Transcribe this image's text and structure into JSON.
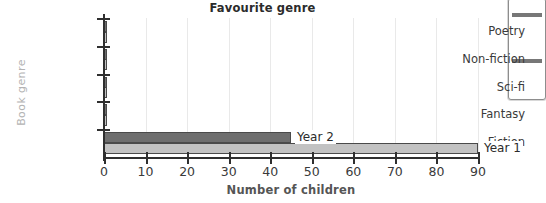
{
  "chart_data": {
    "type": "bar",
    "orientation": "horizontal",
    "title": "Favourite genre",
    "xlabel": "Number of children",
    "ylabel": "Book genre",
    "categories": [
      "Fiction",
      "Fantasy",
      "Sci-fi",
      "Non-fiction",
      "Poetry"
    ],
    "series": [
      {
        "name": "Year 2",
        "color": "#6e6e6e",
        "values": [
          45,
          0,
          0,
          0,
          0
        ]
      },
      {
        "name": "Year 1",
        "color": "#c2c2c2",
        "values": [
          90,
          0,
          0,
          0,
          0
        ]
      }
    ],
    "xlim": [
      0,
      90
    ],
    "xticks": [
      0,
      10,
      20,
      30,
      40,
      50,
      60,
      70,
      80,
      90
    ],
    "xtick_labels": [
      "0",
      "10",
      "20",
      "30",
      "40",
      "50",
      "60",
      "70",
      "80",
      "90"
    ],
    "grid": "vertical",
    "legend": "inline-bar-end-labels",
    "annotations": [
      {
        "text": "Year 2",
        "at_value": 45,
        "category": "Fiction"
      },
      {
        "text": "Year 1",
        "at_value": 90,
        "category": "Fiction"
      }
    ]
  },
  "colors": {
    "axis": "#2f2f2f",
    "grid": "#e9e9e9",
    "title_text": "#2b2b2b",
    "tick_text": "#3a3a3a",
    "ylabel_text": "#b3b3b3",
    "xlabel_text": "#555555",
    "bar_border": "#4a4a4a"
  },
  "side_panel": {
    "name": "clipped-panel"
  }
}
